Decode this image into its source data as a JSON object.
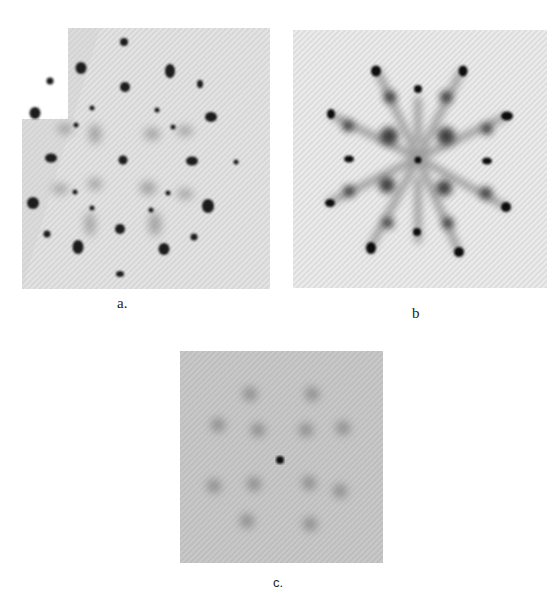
{
  "figure": {
    "panels": [
      {
        "id": "a",
        "label": "a.",
        "description": "diffraction pattern with sharp spots, upper-left corner cut"
      },
      {
        "id": "b",
        "label": "b",
        "description": "diffraction pattern with star-like streaked spots"
      },
      {
        "id": "c",
        "label": "c.",
        "description": "faint diffraction pattern with diffuse spots"
      }
    ]
  }
}
